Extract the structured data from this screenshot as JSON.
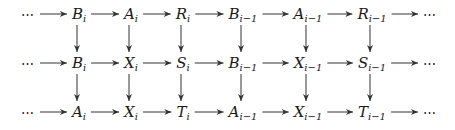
{
  "diagram": {
    "type": "commutative-diagram",
    "rows": [
      {
        "name": "top-row",
        "nodes": [
          {
            "id": "r0c0",
            "base": "⋯",
            "sub": ""
          },
          {
            "id": "r0c1",
            "base": "B",
            "sub": "i"
          },
          {
            "id": "r0c2",
            "base": "A",
            "sub": "i"
          },
          {
            "id": "r0c3",
            "base": "R",
            "sub": "i"
          },
          {
            "id": "r0c4",
            "base": "B",
            "sub": "i−1"
          },
          {
            "id": "r0c5",
            "base": "A",
            "sub": "i−1"
          },
          {
            "id": "r0c6",
            "base": "R",
            "sub": "i−1"
          },
          {
            "id": "r0c7",
            "base": "⋯",
            "sub": ""
          }
        ]
      },
      {
        "name": "middle-row",
        "nodes": [
          {
            "id": "r1c0",
            "base": "⋯",
            "sub": ""
          },
          {
            "id": "r1c1",
            "base": "B",
            "sub": "i"
          },
          {
            "id": "r1c2",
            "base": "X",
            "sub": "i"
          },
          {
            "id": "r1c3",
            "base": "S",
            "sub": "i"
          },
          {
            "id": "r1c4",
            "base": "B",
            "sub": "i−1"
          },
          {
            "id": "r1c5",
            "base": "X",
            "sub": "i−1"
          },
          {
            "id": "r1c6",
            "base": "S",
            "sub": "i−1"
          },
          {
            "id": "r1c7",
            "base": "⋯",
            "sub": ""
          }
        ]
      },
      {
        "name": "bottom-row",
        "nodes": [
          {
            "id": "r2c0",
            "base": "⋯",
            "sub": ""
          },
          {
            "id": "r2c1",
            "base": "A",
            "sub": "i"
          },
          {
            "id": "r2c2",
            "base": "X",
            "sub": "i"
          },
          {
            "id": "r2c3",
            "base": "T",
            "sub": "i"
          },
          {
            "id": "r2c4",
            "base": "A",
            "sub": "i−1"
          },
          {
            "id": "r2c5",
            "base": "X",
            "sub": "i−1"
          },
          {
            "id": "r2c6",
            "base": "T",
            "sub": "i−1"
          },
          {
            "id": "r2c7",
            "base": "⋯",
            "sub": ""
          }
        ]
      }
    ],
    "horizontal_arrows": "each row: consecutive nodes connected left-to-right",
    "vertical_arrows": [
      {
        "from": "r0c1",
        "to": "r1c1"
      },
      {
        "from": "r0c2",
        "to": "r1c2"
      },
      {
        "from": "r0c3",
        "to": "r1c3"
      },
      {
        "from": "r0c4",
        "to": "r1c4"
      },
      {
        "from": "r0c5",
        "to": "r1c5"
      },
      {
        "from": "r0c6",
        "to": "r1c6"
      },
      {
        "from": "r1c1",
        "to": "r2c1"
      },
      {
        "from": "r1c2",
        "to": "r2c2"
      },
      {
        "from": "r1c3",
        "to": "r2c3"
      },
      {
        "from": "r1c4",
        "to": "r2c4"
      },
      {
        "from": "r1c5",
        "to": "r2c5"
      },
      {
        "from": "r1c6",
        "to": "r2c6"
      }
    ],
    "layout": {
      "columns_x": [
        28,
        79,
        131,
        183,
        243,
        308,
        372,
        430
      ],
      "rows_y": [
        14,
        63,
        112
      ]
    }
  }
}
